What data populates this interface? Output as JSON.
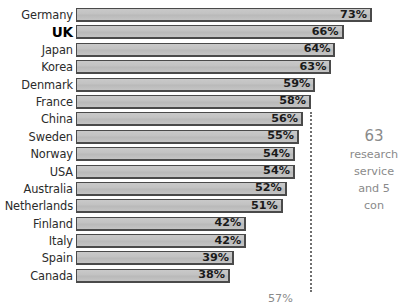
{
  "chart_data": {
    "type": "bar",
    "title": "",
    "subtitle": "",
    "xlabel": "",
    "ylabel": "",
    "orientation": "horizontal",
    "grid": false,
    "legend": "none",
    "xlim": [
      0,
      75
    ],
    "value_suffix": "%",
    "highlight_category": "UK",
    "categories": [
      "Germany",
      "UK",
      "Japan",
      "Korea",
      "Denmark",
      "France",
      "China",
      "Sweden",
      "Norway",
      "USA",
      "Australia",
      "Netherlands",
      "Finland",
      "Italy",
      "Spain",
      "Canada"
    ],
    "values": [
      73,
      66,
      64,
      63,
      59,
      58,
      56,
      55,
      54,
      54,
      52,
      51,
      42,
      42,
      39,
      38
    ],
    "value_labels": [
      "73%",
      "66%",
      "64%",
      "63%",
      "59%",
      "58%",
      "56%",
      "55%",
      "54%",
      "54%",
      "52%",
      "51%",
      "42%",
      "42%",
      "39%",
      "38%"
    ],
    "annotations": [
      {
        "name": "reference-line",
        "kind": "dotted-vertical-line",
        "value": 56
      },
      {
        "name": "side-note",
        "text_lines": [
          "63",
          "research",
          "service",
          "and 5",
          "con"
        ]
      },
      {
        "name": "bottom-note",
        "text": "57%"
      }
    ]
  },
  "bars": [
    {
      "label": "Germany",
      "value": 73,
      "value_label": "73%",
      "highlight": false
    },
    {
      "label": "UK",
      "value": 66,
      "value_label": "66%",
      "highlight": true
    },
    {
      "label": "Japan",
      "value": 64,
      "value_label": "64%",
      "highlight": false
    },
    {
      "label": "Korea",
      "value": 63,
      "value_label": "63%",
      "highlight": false
    },
    {
      "label": "Denmark",
      "value": 59,
      "value_label": "59%",
      "highlight": false
    },
    {
      "label": "France",
      "value": 58,
      "value_label": "58%",
      "highlight": false
    },
    {
      "label": "China",
      "value": 56,
      "value_label": "56%",
      "highlight": false
    },
    {
      "label": "Sweden",
      "value": 55,
      "value_label": "55%",
      "highlight": false
    },
    {
      "label": "Norway",
      "value": 54,
      "value_label": "54%",
      "highlight": false
    },
    {
      "label": "USA",
      "value": 54,
      "value_label": "54%",
      "highlight": false
    },
    {
      "label": "Australia",
      "value": 52,
      "value_label": "52%",
      "highlight": false
    },
    {
      "label": "Netherlands",
      "value": 51,
      "value_label": "51%",
      "highlight": false
    },
    {
      "label": "Finland",
      "value": 42,
      "value_label": "42%",
      "highlight": false
    },
    {
      "label": "Italy",
      "value": 42,
      "value_label": "42%",
      "highlight": false
    },
    {
      "label": "Spain",
      "value": 39,
      "value_label": "39%",
      "highlight": false
    },
    {
      "label": "Canada",
      "value": 38,
      "value_label": "38%",
      "highlight": false
    }
  ],
  "side_note": {
    "line1": "63",
    "line2": "research",
    "line3": "service",
    "line4": "and 5",
    "line5": "con"
  },
  "bottom_note": {
    "text": "57%"
  },
  "colors": {
    "bar_fill": "#c4c4c4",
    "bar_border": "#4a4a4a",
    "label_text": "#2b2b2b",
    "note_text": "#8a8a8a",
    "dotted_line": "#6f6f6f"
  }
}
